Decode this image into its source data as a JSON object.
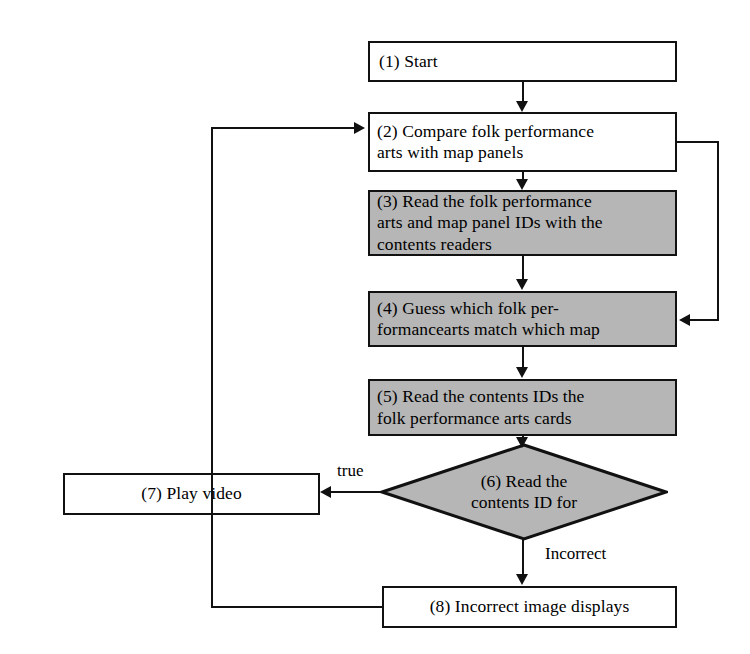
{
  "figure": {
    "type": "flowchart",
    "background_color": "#ffffff",
    "line_color": "#111111",
    "shaded_fill": "#b6b6b6",
    "plain_fill": "#ffffff"
  },
  "nodes": [
    {
      "id": "n1",
      "label": "(1) Start",
      "shape": "rectangle",
      "fill": "plain"
    },
    {
      "id": "n2",
      "label": "(2)  Compare  folk  performance\narts with map panels",
      "shape": "rectangle",
      "fill": "plain"
    },
    {
      "id": "n3",
      "label": "(3)  Read  the  folk  performance\narts and map panel IDs with the\ncontents readers",
      "shape": "rectangle",
      "fill": "shaded"
    },
    {
      "id": "n4",
      "label": "(4)   Guess   which   folk   per-\nformancearts  match  which  map",
      "shape": "rectangle",
      "fill": "shaded"
    },
    {
      "id": "n5",
      "label": "(5)  Read  the  contents  IDs  the\nfolk performance arts cards",
      "shape": "rectangle",
      "fill": "shaded"
    },
    {
      "id": "n6",
      "label": "(6)   Read   the\ncontents ID for",
      "shape": "diamond",
      "fill": "shaded"
    },
    {
      "id": "n7",
      "label": "(7) Play video",
      "shape": "rectangle",
      "fill": "plain"
    },
    {
      "id": "n8",
      "label": "(8) Incorrect image displays",
      "shape": "rectangle",
      "fill": "plain"
    }
  ],
  "edge_labels": {
    "true": "true",
    "incorrect": "Incorrect"
  }
}
